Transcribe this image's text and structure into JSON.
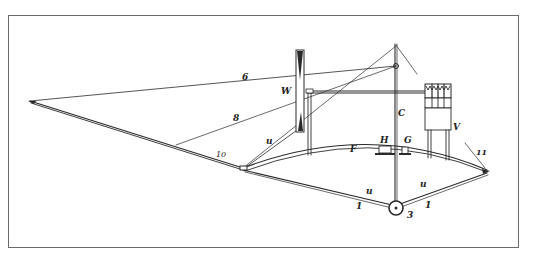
{
  "figure": {
    "type": "technical line drawing",
    "frame": {
      "left": 8,
      "top": 15,
      "right": 519,
      "bottom": 248,
      "stroke": "#6a6a6a"
    },
    "ink_color": "#2a2a2a",
    "labels": {
      "six": "6",
      "eight": "8",
      "ten": "10",
      "w": "W",
      "u_left": "u",
      "u_bottom": "u",
      "u_right": "u",
      "f": "F",
      "h": "H",
      "g": "G",
      "c": "C",
      "v": "V",
      "eleven": "11",
      "one_left": "1",
      "one_right": "1",
      "three": "3"
    }
  }
}
